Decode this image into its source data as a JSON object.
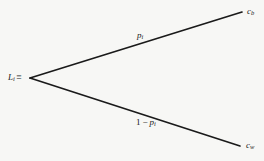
{
  "diagram": {
    "type": "binary-probability-tree",
    "background_color": "#f7f7f5",
    "stroke_color": "#1a1a1a",
    "text_color": "#1a1a1a",
    "root": {
      "variable": "L",
      "subscript": "i",
      "equivalence_symbol": "≡"
    },
    "branches": {
      "upper": {
        "probability_variable": "p",
        "probability_subscript": "i",
        "outcome_variable": "c",
        "outcome_subscript": "b"
      },
      "lower": {
        "probability_number": "1",
        "probability_operator": "−",
        "probability_variable": "p",
        "probability_subscript": "i",
        "outcome_variable": "c",
        "outcome_subscript": "w"
      }
    },
    "geometry": {
      "vertex_x": 30,
      "vertex_y": 78,
      "upper_end_x": 242,
      "upper_end_y": 12,
      "lower_end_x": 240,
      "lower_end_y": 146,
      "stroke_width": 1.7
    }
  }
}
